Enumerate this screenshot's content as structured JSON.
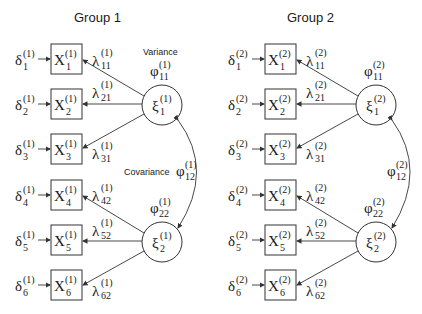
{
  "groups": [
    {
      "title": "Group 1",
      "sup": "(1)",
      "errors": [
        "δ",
        "δ",
        "δ",
        "δ",
        "δ",
        "δ"
      ],
      "indicators": [
        {
          "sym": "X",
          "idx": "1"
        },
        {
          "sym": "X",
          "idx": "2"
        },
        {
          "sym": "X",
          "idx": "3"
        },
        {
          "sym": "X",
          "idx": "4"
        },
        {
          "sym": "X",
          "idx": "5"
        },
        {
          "sym": "X",
          "idx": "6"
        }
      ],
      "loadings": [
        "11",
        "21",
        "31",
        "42",
        "52",
        "62"
      ],
      "factors": [
        {
          "sym": "ξ",
          "idx": "1"
        },
        {
          "sym": "ξ",
          "idx": "2"
        }
      ],
      "variances": [
        "11",
        "22"
      ],
      "covariance": "12",
      "variance_label": "Variance",
      "covariance_label": "Covariance"
    },
    {
      "title": "Group 2",
      "sup": "(2)",
      "loadings": [
        "11",
        "21",
        "31",
        "42",
        "52",
        "62"
      ],
      "variances": [
        "11",
        "22"
      ],
      "covariance": "12"
    }
  ],
  "symbols": {
    "error": "δ",
    "indicator": "X",
    "loading": "λ",
    "factor": "ξ",
    "phi": "φ"
  }
}
